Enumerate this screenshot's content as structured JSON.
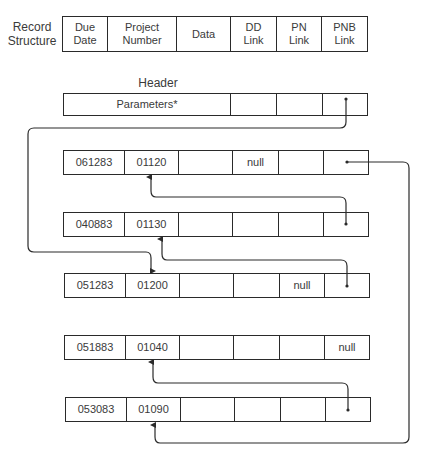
{
  "record_structure": {
    "label_line1": "Record",
    "label_line2": "Structure",
    "fields": [
      {
        "line1": "Due",
        "line2": "Date"
      },
      {
        "line1": "Project",
        "line2": "Number"
      },
      {
        "line1": "Data",
        "line2": ""
      },
      {
        "line1": "DD",
        "line2": "Link"
      },
      {
        "line1": "PN",
        "line2": "Link"
      },
      {
        "line1": "PNB",
        "line2": "Link"
      }
    ]
  },
  "header": {
    "title": "Header",
    "parameters": "Parameters*"
  },
  "records": [
    {
      "due_date": "061283",
      "project_number": "01120",
      "data": "",
      "dd_link": "null",
      "pn_link": "",
      "pnb_link": "•"
    },
    {
      "due_date": "040883",
      "project_number": "01130",
      "data": "",
      "dd_link": "",
      "pn_link": "",
      "pnb_link": "•"
    },
    {
      "due_date": "051283",
      "project_number": "01200",
      "data": "",
      "dd_link": "",
      "pn_link": "null",
      "pnb_link": "•"
    },
    {
      "due_date": "051883",
      "project_number": "01040",
      "data": "",
      "dd_link": "",
      "pn_link": "",
      "pnb_link": "null"
    },
    {
      "due_date": "053083",
      "project_number": "01090",
      "data": "",
      "dd_link": "",
      "pn_link": "",
      "pnb_link": "•"
    }
  ],
  "links": [
    {
      "from": "header.pnb_link",
      "to": "051283.project_number"
    },
    {
      "from": "061283.pnb_link",
      "to": "053083.project_number"
    },
    {
      "from": "040883.pnb_link",
      "to": "061283.project_number"
    },
    {
      "from": "051283.pnb_link",
      "to": "040883.project_number"
    },
    {
      "from": "053083.pnb_link",
      "to": "051883.project_number"
    }
  ]
}
